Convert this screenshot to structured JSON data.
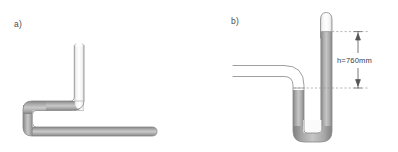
{
  "figure": {
    "background_color": "#ffffff",
    "panels": [
      {
        "id": "panel-a",
        "label": "a)",
        "description": "Bent tube with mercury in lower horizontal leg and U-bend, open vertical riser empty"
      },
      {
        "id": "panel-b",
        "label": "b)",
        "description": "U-tube mercury barometer with sealed evacuated top and measured column height"
      }
    ],
    "annotations": {
      "height_label": "h=760mm"
    },
    "colors": {
      "tube_outline": "#8c8c8c",
      "tube_outline_light": "#b9b9b9",
      "mercury_fill_dark": "#8e8e8e",
      "mercury_fill_light": "#c9c9c9",
      "empty_fill": "#ffffff",
      "dimension_line": "#555555",
      "reference_line": "#9a9a9a",
      "label_text": "#4a4a4a"
    }
  }
}
